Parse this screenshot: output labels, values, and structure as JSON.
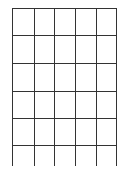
{
  "diagram": {
    "type": "grid",
    "columns": 5,
    "rows": 5,
    "open_bottom_row": true,
    "line_color": "#333333",
    "vertical_lines_x": [
      12,
      34,
      54,
      75,
      96,
      116
    ],
    "horizontal_lines_y": [
      8,
      35,
      63,
      91,
      118,
      145
    ],
    "vertical_line_extent": [
      8,
      166
    ]
  }
}
